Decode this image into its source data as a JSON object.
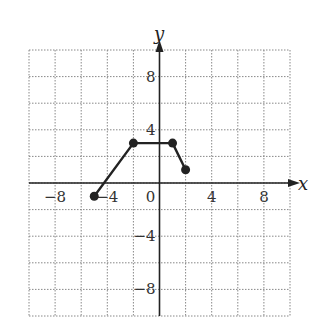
{
  "chart_data": {
    "type": "line",
    "title": "",
    "xlabel": "x",
    "ylabel": "y",
    "xlim": [
      -10,
      10
    ],
    "ylim": [
      -10,
      10
    ],
    "grid": true,
    "grid_step": 2,
    "x_ticks": [
      -8,
      -4,
      0,
      4,
      8
    ],
    "y_ticks": [
      8,
      4,
      -4,
      -8
    ],
    "x_tick_labels": [
      "−8",
      "−4",
      "0",
      "4",
      "8"
    ],
    "y_tick_labels": [
      "8",
      "4",
      "−4",
      "−8"
    ],
    "series": [
      {
        "name": "piecewise function",
        "points": [
          [
            -5,
            -1
          ],
          [
            -2,
            3
          ],
          [
            1,
            3
          ],
          [
            2,
            1
          ]
        ],
        "endpoints": "closed",
        "color": "#222222"
      }
    ]
  },
  "labels": {
    "x_axis": "x",
    "y_axis": "y"
  }
}
